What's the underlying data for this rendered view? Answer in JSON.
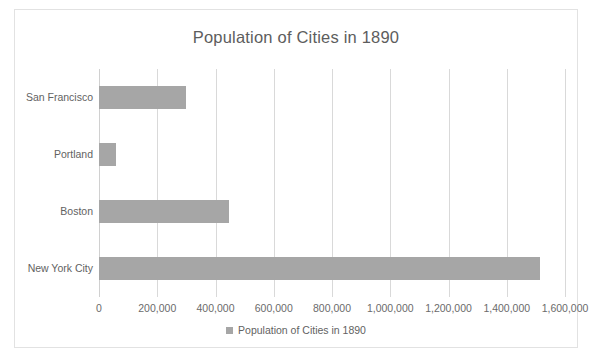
{
  "chart_data": {
    "type": "bar",
    "orientation": "horizontal",
    "title": "Population of Cities in 1890",
    "xlabel": "",
    "ylabel": "",
    "categories": [
      "San Francisco",
      "Portland",
      "Boston",
      "New York City"
    ],
    "values": [
      299000,
      58000,
      448000,
      1515000
    ],
    "series": [
      {
        "name": "Population of Cities in 1890",
        "values": [
          299000,
          58000,
          448000,
          1515000
        ],
        "color": "#a6a6a6"
      }
    ],
    "xlim": [
      0,
      1600000
    ],
    "xticks": [
      0,
      200000,
      400000,
      600000,
      800000,
      1000000,
      1200000,
      1400000,
      1600000
    ],
    "xtick_labels": [
      "0",
      "200,000",
      "400,000",
      "600,000",
      "800,000",
      "1,000,000",
      "1,200,000",
      "1,400,000",
      "1,600,000"
    ],
    "grid": "vertical",
    "legend": {
      "position": "bottom",
      "entries": [
        {
          "label": "Population of Cities in 1890",
          "marker": "square",
          "color": "#a6a6a6"
        }
      ]
    },
    "colors": {
      "bar": "#a6a6a6",
      "gridline": "#d9d9d9",
      "text": "#626262",
      "title": "#5d5d5d",
      "border": "#e2e2e2",
      "background": "#ffffff"
    }
  }
}
